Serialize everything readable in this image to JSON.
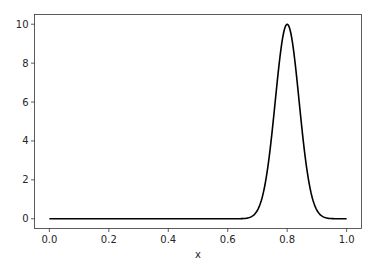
{
  "chart_data": {
    "type": "line",
    "title": "",
    "xlabel": "x",
    "ylabel": "",
    "xlim": [
      -0.05,
      1.05
    ],
    "ylim": [
      -0.5,
      10.5
    ],
    "grid": false,
    "legend": null,
    "x_ticks": [
      0.0,
      0.2,
      0.4,
      0.6,
      0.8,
      1.0
    ],
    "x_tick_labels": [
      "0.0",
      "0.2",
      "0.4",
      "0.6",
      "0.8",
      "1.0"
    ],
    "y_ticks": [
      0,
      2,
      4,
      6,
      8,
      10
    ],
    "y_tick_labels": [
      "0",
      "2",
      "4",
      "6",
      "8",
      "10"
    ],
    "series": [
      {
        "name": "f(x)",
        "color": "#000000",
        "description": "Gaussian bump centered at x=0.8, peak 10, sigma approx 0.04; ~0 elsewhere",
        "x": [
          0.0,
          0.1,
          0.2,
          0.3,
          0.4,
          0.5,
          0.6,
          0.65,
          0.68,
          0.7,
          0.72,
          0.74,
          0.76,
          0.78,
          0.8,
          0.82,
          0.84,
          0.86,
          0.88,
          0.9,
          0.92,
          0.95,
          1.0
        ],
        "values": [
          0,
          0,
          0,
          0,
          0,
          0,
          0.0,
          0.09,
          0.44,
          0.96,
          1.35,
          3.25,
          6.07,
          8.82,
          10.0,
          8.82,
          6.07,
          3.25,
          1.35,
          0.44,
          0.11,
          0.01,
          0
        ]
      }
    ]
  }
}
